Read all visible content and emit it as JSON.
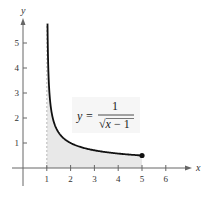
{
  "chart_data": {
    "type": "area",
    "title": "",
    "function": "y = 1/sqrt(x - 1)",
    "equation_label": {
      "lhs": "y =",
      "numerator": "1",
      "denominator": "√x − 1",
      "denominator_var": "x",
      "denominator_rest": " − 1"
    },
    "xlabel": "x",
    "ylabel": "y",
    "xlim": [
      0,
      6.5
    ],
    "ylim": [
      0,
      6
    ],
    "x_ticks": [
      1,
      2,
      3,
      4,
      5,
      6
    ],
    "y_ticks": [
      1,
      2,
      3,
      4,
      5
    ],
    "shaded_region": {
      "from_x": 1,
      "to_x": 5,
      "fill": "#e8e8e8"
    },
    "endpoint": {
      "x": 5,
      "y": 0.5
    },
    "curve_points": [
      {
        "x": 1.03,
        "y": 5.7
      },
      {
        "x": 1.05,
        "y": 4.47
      },
      {
        "x": 1.1,
        "y": 3.16
      },
      {
        "x": 1.2,
        "y": 2.24
      },
      {
        "x": 1.4,
        "y": 1.58
      },
      {
        "x": 1.7,
        "y": 1.2
      },
      {
        "x": 2,
        "y": 1.0
      },
      {
        "x": 2.5,
        "y": 0.82
      },
      {
        "x": 3,
        "y": 0.71
      },
      {
        "x": 3.5,
        "y": 0.63
      },
      {
        "x": 4,
        "y": 0.58
      },
      {
        "x": 4.5,
        "y": 0.53
      },
      {
        "x": 5,
        "y": 0.5
      }
    ],
    "grid": false,
    "legend": "none",
    "colors": {
      "curve": "#111111",
      "axis": "#555555",
      "fill": "#e8e8e8",
      "asymptote": "#999999"
    }
  }
}
